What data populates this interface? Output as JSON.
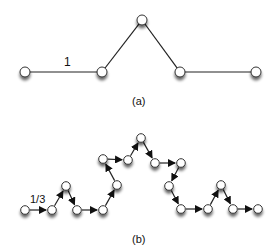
{
  "figure": {
    "panel_a": {
      "caption": "(a)",
      "segment_label": "1",
      "nodes": [
        [
          25,
          72
        ],
        [
          102,
          72
        ],
        [
          142,
          20
        ],
        [
          180,
          72
        ],
        [
          256,
          72
        ]
      ]
    },
    "panel_b": {
      "caption": "(b)",
      "segment_label": "1/3",
      "nodes": [
        [
          25,
          210
        ],
        [
          52,
          210
        ],
        [
          66,
          186
        ],
        [
          77,
          210
        ],
        [
          103,
          210
        ],
        [
          117,
          185
        ],
        [
          103,
          159
        ],
        [
          128,
          160
        ],
        [
          141,
          138
        ],
        [
          155,
          163
        ],
        [
          181,
          163
        ],
        [
          169,
          186
        ],
        [
          181,
          209
        ],
        [
          208,
          209
        ],
        [
          221,
          185
        ],
        [
          233,
          209
        ],
        [
          258,
          209
        ]
      ]
    }
  },
  "colors": {
    "line": "#222222",
    "node_fill": "#ffffff",
    "node_stroke": "#333333"
  }
}
